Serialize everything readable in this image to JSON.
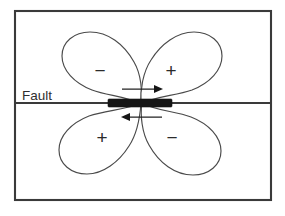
{
  "figure": {
    "background_color": "#ffffff",
    "frame_color": "#3a3a3a",
    "line_color": "#4a4a4a",
    "bar_color": "#161616",
    "arrow_color": "#161616"
  },
  "labels": {
    "fault": "Fault"
  },
  "lobes": [
    {
      "id": "upper-left",
      "sign": "−",
      "quadrant": "upper-left",
      "sign_x": 100,
      "sign_y": 70
    },
    {
      "id": "upper-right",
      "sign": "+",
      "quadrant": "upper-right",
      "sign_x": 171,
      "sign_y": 70
    },
    {
      "id": "lower-left",
      "sign": "+",
      "quadrant": "lower-left",
      "sign_x": 102,
      "sign_y": 137
    },
    {
      "id": "lower-right",
      "sign": "−",
      "quadrant": "lower-right",
      "sign_x": 172,
      "sign_y": 137
    }
  ],
  "arrows": [
    {
      "id": "upper-slip-arrow",
      "direction": "right",
      "x1": 122,
      "y1": 89,
      "x2": 160,
      "y2": 89
    },
    {
      "id": "lower-slip-arrow",
      "direction": "left",
      "x1": 162,
      "y1": 117,
      "x2": 124,
      "y2": 117
    }
  ],
  "fault_plane": {
    "line_y": 103,
    "line_x1": 15,
    "line_x2": 271,
    "slip_bar": {
      "x": 108,
      "y": 99,
      "width": 64,
      "height": 8
    }
  },
  "frame": {
    "x": 15,
    "y": 11,
    "width": 256,
    "height": 189
  }
}
